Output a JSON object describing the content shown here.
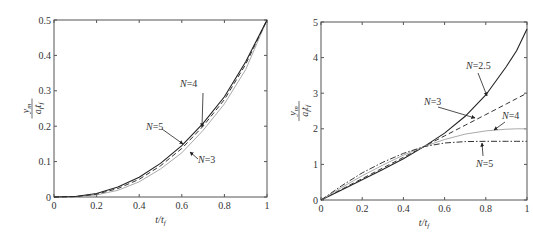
{
  "chart_data": [
    {
      "type": "line",
      "title": "",
      "xlabel": "t/t_f",
      "ylabel": "y_m / (a_f t_f^2)",
      "xlim": [
        0,
        1
      ],
      "ylim": [
        0,
        0.5
      ],
      "xticks": [
        "0",
        "0.2",
        "0.4",
        "0.6",
        "0.8",
        "1"
      ],
      "yticks": [
        "0",
        "0.1",
        "0.2",
        "0.3",
        "0.4",
        "0.5"
      ],
      "grid": false,
      "x": [
        0,
        0.1,
        0.2,
        0.3,
        0.4,
        0.5,
        0.6,
        0.7,
        0.8,
        0.9,
        1.0
      ],
      "series": [
        {
          "name": "N=3",
          "style": "dotted-gray",
          "values": [
            0,
            0.0008,
            0.006,
            0.019,
            0.043,
            0.079,
            0.125,
            0.188,
            0.263,
            0.36,
            0.5
          ]
        },
        {
          "name": "N=4",
          "style": "dashed",
          "values": [
            0,
            0.0012,
            0.008,
            0.024,
            0.05,
            0.088,
            0.137,
            0.2,
            0.275,
            0.375,
            0.5
          ]
        },
        {
          "name": "N=5",
          "style": "solid",
          "values": [
            0,
            0.0015,
            0.01,
            0.028,
            0.056,
            0.095,
            0.145,
            0.208,
            0.283,
            0.382,
            0.5
          ]
        }
      ],
      "annotations": [
        {
          "text": "N=4",
          "x": 0.7,
          "y": 0.19
        },
        {
          "text": "N=5",
          "x": 0.62,
          "y": 0.14
        },
        {
          "text": "N=3",
          "x": 0.64,
          "y": 0.12
        }
      ]
    },
    {
      "type": "line",
      "title": "",
      "xlabel": "t/t_f",
      "ylabel": "y_m / (a_f t_f^2)",
      "xlim": [
        0,
        1
      ],
      "ylim": [
        0,
        5
      ],
      "xticks": [
        "0",
        "0.2",
        "0.4",
        "0.6",
        "0.8",
        "1"
      ],
      "yticks": [
        "0",
        "1",
        "2",
        "3",
        "4",
        "5"
      ],
      "grid": false,
      "x": [
        0,
        0.1,
        0.2,
        0.3,
        0.4,
        0.5,
        0.6,
        0.7,
        0.8,
        0.9,
        0.95,
        1.0
      ],
      "series": [
        {
          "name": "N=2.5",
          "style": "solid",
          "values": [
            0,
            0.28,
            0.57,
            0.86,
            1.16,
            1.5,
            1.88,
            2.35,
            2.95,
            3.75,
            4.2,
            4.8
          ]
        },
        {
          "name": "N=3",
          "style": "dashed",
          "values": [
            0,
            0.3,
            0.6,
            0.9,
            1.2,
            1.5,
            1.8,
            2.1,
            2.4,
            2.7,
            2.85,
            3.0
          ]
        },
        {
          "name": "N=4",
          "style": "dotted-gray",
          "values": [
            0,
            0.35,
            0.68,
            0.98,
            1.26,
            1.5,
            1.7,
            1.85,
            1.94,
            1.99,
            2.0,
            2.0
          ]
        },
        {
          "name": "N=5",
          "style": "dash-dot",
          "values": [
            0,
            0.4,
            0.76,
            1.06,
            1.31,
            1.5,
            1.6,
            1.64,
            1.65,
            1.65,
            1.65,
            1.65
          ]
        }
      ],
      "annotations": [
        {
          "text": "N=2.5",
          "x": 0.8,
          "y": 2.95
        },
        {
          "text": "N=3",
          "x": 0.74,
          "y": 2.25
        },
        {
          "text": "N=4",
          "x": 0.86,
          "y": 1.97
        },
        {
          "text": "N=5",
          "x": 0.8,
          "y": 1.65
        }
      ]
    }
  ]
}
